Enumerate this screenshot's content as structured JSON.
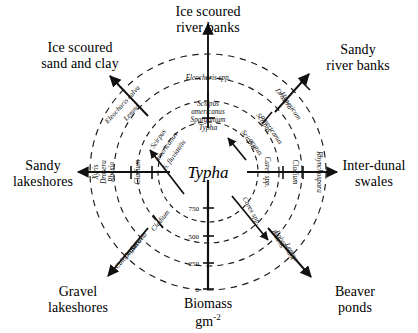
{
  "diagram": {
    "type": "radial-wheel",
    "center_label": "Typha",
    "axis": {
      "title_line1": "Biomass",
      "title_line2_base": "gm",
      "title_line2_exp": "-2",
      "ticks": [
        "750",
        "500",
        "250",
        "0"
      ],
      "tick_values": [
        750,
        500,
        250,
        0
      ],
      "direction": "downward from centre"
    },
    "rings": [
      {
        "index": 1,
        "label": "innermost"
      },
      {
        "index": 2,
        "label": "inner-mid"
      },
      {
        "index": 3,
        "label": "outer-mid"
      },
      {
        "index": 4,
        "label": "outermost"
      }
    ],
    "habitats": [
      {
        "id": "north",
        "label": "Ice scoured\nriver banks"
      },
      {
        "id": "northeast",
        "label": "Sandy\nriver banks"
      },
      {
        "id": "east",
        "label": "Inter-dunal\nswales"
      },
      {
        "id": "southeast",
        "label": "Beaver\nponds"
      },
      {
        "id": "southwest",
        "label": "Gravel\nlakeshores"
      },
      {
        "id": "west",
        "label": "Sandy\nlakeshores"
      },
      {
        "id": "northwest",
        "label": "Ice scoured\nsand and clay"
      }
    ],
    "species_labels": {
      "north": [
        "Typha",
        "Scirpus\namericanus\nSparganium",
        "Eleocharis spp."
      ],
      "northwest_inner": [
        "Scirpus",
        "americanus",
        "S. fluviatilis"
      ],
      "northwest_outer": [
        "Eleocharis calva",
        "Lemna"
      ],
      "west": [
        "Cladium",
        "Xyris",
        "Drosera",
        "Rhexia"
      ],
      "southwest": [
        "Cladium",
        "Sabatia",
        "Drosera",
        "Calopogon"
      ],
      "east": [
        "Carex spp.",
        "Cladium",
        "Rhynchospora"
      ],
      "northeast_inner": [
        "Scirpus",
        "acutus",
        "Scirpus",
        "americanus"
      ],
      "northeast_outer": [
        "Drosera",
        "Hypericum"
      ],
      "southeast": [
        "Carex spp.",
        "Bidens",
        "Polygonum",
        "Lemna"
      ]
    },
    "colors": {
      "ink": "#111111",
      "ring": "#222222",
      "background": "#ffffff"
    }
  }
}
